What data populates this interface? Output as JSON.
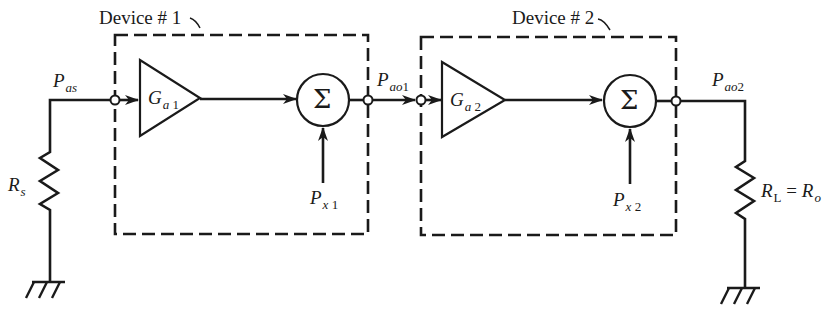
{
  "diagram": {
    "type": "block-diagram",
    "colors": {
      "line": "#1a1a1a",
      "background": "#ffffff"
    },
    "devices": [
      {
        "label": "Device # 1",
        "gain": {
          "symbol": "G",
          "sub": "a",
          "index": "1"
        },
        "sum_symbol": "Σ",
        "noise_input": {
          "symbol": "P",
          "sub": "x",
          "index": "1"
        },
        "output": {
          "symbol": "P",
          "sub": "ao",
          "index": "1"
        }
      },
      {
        "label": "Device # 2",
        "gain": {
          "symbol": "G",
          "sub": "a",
          "index": "2"
        },
        "sum_symbol": "Σ",
        "noise_input": {
          "symbol": "P",
          "sub": "x",
          "index": "2"
        },
        "output": {
          "symbol": "P",
          "sub": "ao",
          "index": "2"
        }
      }
    ],
    "source": {
      "power": {
        "symbol": "P",
        "sub": "as"
      },
      "resistor": {
        "symbol": "R",
        "sub": "s"
      }
    },
    "load": {
      "resistor": {
        "symbol": "R",
        "sub": "L",
        "equals": "= ",
        "rhs_symbol": "R",
        "rhs_sub": "o"
      }
    },
    "ground_symbols": 2
  }
}
